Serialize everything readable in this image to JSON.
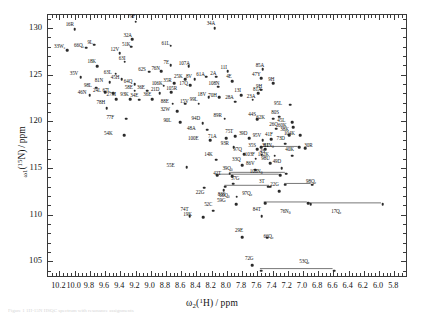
{
  "figure": {
    "caption": "Figure 1  1H-15N HSQC spectrum with resonance assignments"
  },
  "chart_data": {
    "type": "scatter",
    "title": "",
    "xlabel": "ω₂(¹H)/ppm",
    "ylabel": "ω₁(¹⁵N)/ppm",
    "xlim": [
      10.35,
      5.62
    ],
    "ylim": [
      131.4,
      103.2
    ],
    "x_inverted": true,
    "y_inverted": true,
    "grid": false,
    "legend": null,
    "xticks": [
      10.2,
      10.0,
      9.8,
      9.6,
      9.4,
      9.2,
      9.0,
      8.8,
      8.6,
      8.4,
      8.2,
      8.0,
      7.8,
      7.6,
      7.4,
      7.2,
      7.0,
      6.8,
      6.6,
      6.4,
      6.2,
      6.0,
      5.8
    ],
    "xticklabels": [
      "10.2",
      "10.0",
      "9.8",
      "9.6",
      "9.4",
      "9.2",
      "9.0",
      "8.8",
      "8.6",
      "8.4",
      "8.2",
      "8.0",
      "7.8",
      "7.6",
      "7.4",
      "7.2",
      "7.0",
      "6.8",
      "6.6",
      "6.4",
      "6.2",
      "6.0",
      "5.8"
    ],
    "xtick_minor_step": 0.05,
    "yticks": [
      105,
      110,
      115,
      120,
      125,
      130
    ],
    "yticklabels": [
      "105",
      "110",
      "115",
      "120",
      "125",
      "130"
    ],
    "ytick_minor_step": 1,
    "marker": "filled-circle",
    "marker_color": "#2b2b2b",
    "sidechain_link_color": "#555555",
    "points": [
      {
        "label": "29E",
        "sub": "",
        "x": 7.8,
        "y": 107.6,
        "lx": -3,
        "ly": -6
      },
      {
        "label": "72G",
        "sub": "",
        "x": 7.67,
        "y": 104.6,
        "lx": -3,
        "ly": -6
      },
      {
        "label": "19K",
        "sub": "",
        "x": 8.31,
        "y": 109.7,
        "lx": -16,
        "ly": -2
      },
      {
        "label": "59G",
        "sub": "",
        "x": 7.88,
        "y": 111.1,
        "lx": -15,
        "ly": -3
      },
      {
        "label": "83S",
        "sub": "",
        "x": 7.87,
        "y": 111.9,
        "lx": -15,
        "ly": -2
      },
      {
        "label": "37G",
        "sub": "",
        "x": 7.92,
        "y": 113.3,
        "lx": 2,
        "ly": -5
      },
      {
        "label": "42T",
        "sub": "",
        "x": 7.93,
        "y": 114.1,
        "lx": -15,
        "ly": -2
      },
      {
        "label": "74T",
        "sub": "",
        "x": 8.49,
        "y": 109.8,
        "lx": -5,
        "ly": -6
      },
      {
        "label": "52C",
        "sub": "",
        "x": 8.18,
        "y": 110.4,
        "lx": -5,
        "ly": -6
      },
      {
        "label": "84T",
        "sub": "",
        "x": 7.54,
        "y": 109.8,
        "lx": -5,
        "ly": -6
      },
      {
        "label": "3T",
        "sub": "",
        "x": 7.46,
        "y": 113.0,
        "lx": -5,
        "ly": -5
      },
      {
        "label": "22G",
        "sub": "",
        "x": 7.31,
        "y": 112.5,
        "lx": -5,
        "ly": -6
      },
      {
        "label": "49D",
        "sub": "",
        "x": 7.28,
        "y": 115.0,
        "lx": -5,
        "ly": -6
      },
      {
        "label": "55E",
        "sub": "",
        "x": 8.53,
        "y": 115.1,
        "lx": -16,
        "ly": -1
      },
      {
        "label": "14K",
        "sub": "",
        "x": 8.14,
        "y": 115.9,
        "lx": -8,
        "ly": -5
      },
      {
        "label": "33Q",
        "sub": "",
        "x": 7.8,
        "y": 115.3,
        "lx": -6,
        "ly": -5
      },
      {
        "label": "86V",
        "sub": "",
        "x": 7.63,
        "y": 114.8,
        "lx": -5,
        "ly": -6
      },
      {
        "label": "97Q",
        "sub": "",
        "x": 7.77,
        "y": 116.5,
        "lx": -7,
        "ly": -4
      },
      {
        "label": "4S",
        "sub": "",
        "x": 7.54,
        "y": 116.4,
        "lx": 2,
        "ly": -3
      },
      {
        "label": "93R",
        "sub": "",
        "x": 7.91,
        "y": 117.2,
        "lx": -9,
        "ly": -3
      },
      {
        "label": "35S",
        "sub": "",
        "x": 7.6,
        "y": 117.0,
        "lx": -5,
        "ly": -3
      },
      {
        "label": "31I",
        "sub": "",
        "x": 7.5,
        "y": 117.0,
        "lx": 1,
        "ly": -3
      },
      {
        "label": "54K",
        "sub": "",
        "x": 9.35,
        "y": 118.5,
        "lx": -16,
        "ly": -1
      },
      {
        "label": "100E",
        "sub": "",
        "x": 8.22,
        "y": 118.0,
        "lx": -18,
        "ly": -1
      },
      {
        "label": "71A",
        "sub": "",
        "x": 8.01,
        "y": 118.2,
        "lx": -14,
        "ly": -1
      },
      {
        "label": "48A",
        "sub": "",
        "x": 8.26,
        "y": 119.1,
        "lx": -16,
        "ly": -1
      },
      {
        "label": "75T",
        "sub": "",
        "x": 7.89,
        "y": 118.4,
        "lx": -6,
        "ly": -4
      },
      {
        "label": "39D",
        "sub": "",
        "x": 7.71,
        "y": 118.2,
        "lx": -6,
        "ly": -4
      },
      {
        "label": "95V",
        "sub": "",
        "x": 7.53,
        "y": 118.0,
        "lx": -6,
        "ly": -4
      },
      {
        "label": "41F",
        "sub": "",
        "x": 7.42,
        "y": 118.1,
        "lx": -2,
        "ly": -4
      },
      {
        "label": "73D",
        "sub": "",
        "x": 7.23,
        "y": 117.6,
        "lx": -5,
        "ly": -5
      },
      {
        "label": "38K",
        "sub": "",
        "x": 7.18,
        "y": 118.5,
        "lx": -5,
        "ly": -5
      },
      {
        "label": "62K",
        "sub": "",
        "x": 7.39,
        "y": 120.3,
        "lx": -13,
        "ly": -1
      },
      {
        "label": "26Q",
        "sub": "",
        "x": 7.35,
        "y": 119.2,
        "lx": -3,
        "ly": -4
      },
      {
        "label": "77F",
        "sub": "",
        "x": 9.32,
        "y": 120.3,
        "lx": -16,
        "ly": -1
      },
      {
        "label": "90L",
        "sub": "",
        "x": 8.61,
        "y": 119.9,
        "lx": -13,
        "ly": -1
      },
      {
        "label": "32W",
        "sub": "",
        "x": 8.65,
        "y": 121.1,
        "lx": -13,
        "ly": -1
      },
      {
        "label": "94D",
        "sub": "",
        "x": 8.32,
        "y": 119.8,
        "lx": -7,
        "ly": -4
      },
      {
        "label": "89R",
        "sub": "",
        "x": 8.03,
        "y": 120.3,
        "lx": -7,
        "ly": -3
      },
      {
        "label": "44S",
        "sub": "",
        "x": 7.6,
        "y": 120.2,
        "lx": -5,
        "ly": -4
      },
      {
        "label": "80S",
        "sub": "",
        "x": 7.31,
        "y": 120.5,
        "lx": -4,
        "ly": -4
      },
      {
        "label": "45L",
        "sub": "",
        "x": 7.14,
        "y": 119.9,
        "lx": -11,
        "ly": -1
      },
      {
        "label": "78H",
        "sub": "",
        "x": 9.58,
        "y": 121.4,
        "lx": -6,
        "ly": -5
      },
      {
        "label": "27M",
        "sub": "",
        "x": 9.45,
        "y": 122.4,
        "lx": -6,
        "ly": -4
      },
      {
        "label": "93K",
        "sub": "",
        "x": 9.27,
        "y": 122.4,
        "lx": -6,
        "ly": -4
      },
      {
        "label": "88E",
        "sub": "",
        "x": 8.71,
        "y": 121.9,
        "lx": -8,
        "ly": -2
      },
      {
        "label": "15V",
        "sub": "",
        "x": 8.55,
        "y": 121.9,
        "lx": -1,
        "ly": -2
      },
      {
        "label": "99L",
        "sub": "",
        "x": 8.37,
        "y": 121.9,
        "lx": -5,
        "ly": -4
      },
      {
        "label": "18V",
        "sub": "",
        "x": 8.24,
        "y": 122.6,
        "lx": -7,
        "ly": -2
      },
      {
        "label": "70H",
        "sub": "",
        "x": 8.1,
        "y": 122.6,
        "lx": -7,
        "ly": -1
      },
      {
        "label": "28A",
        "sub": "",
        "x": 7.89,
        "y": 122.1,
        "lx": -6,
        "ly": -4
      },
      {
        "label": "23A",
        "sub": "",
        "x": 7.66,
        "y": 122.3,
        "lx": -2,
        "ly": -3
      },
      {
        "label": "95L",
        "sub": "",
        "x": 7.17,
        "y": 121.8,
        "lx": -12,
        "ly": -1
      },
      {
        "label": "34E",
        "sub": "",
        "x": 9.15,
        "y": 122.3,
        "lx": -5,
        "ly": -4
      },
      {
        "label": "36E",
        "sub": "",
        "x": 8.98,
        "y": 122.4,
        "lx": -5,
        "ly": -4
      },
      {
        "label": "13I",
        "sub": "",
        "x": 7.81,
        "y": 122.8,
        "lx": -3,
        "ly": -4
      },
      {
        "label": "81A",
        "sub": "",
        "x": 7.59,
        "y": 123.0,
        "lx": -1,
        "ly": -3
      },
      {
        "label": "24L",
        "sub": "",
        "x": 9.6,
        "y": 123.1,
        "lx": -8,
        "ly": -1
      },
      {
        "label": "67L",
        "sub": "",
        "x": 9.49,
        "y": 123.0,
        "lx": -7,
        "ly": -2
      },
      {
        "label": "58E",
        "sub": "",
        "x": 9.21,
        "y": 123.3,
        "lx": -6,
        "ly": -3
      },
      {
        "label": "36E",
        "sub": "",
        "x": 9.05,
        "y": 123.3,
        "lx": -6,
        "ly": -3
      },
      {
        "label": "21D",
        "sub": "",
        "x": 8.88,
        "y": 123.0,
        "lx": -5,
        "ly": -3
      },
      {
        "label": "105R",
        "sub": "",
        "x": 8.73,
        "y": 123.1,
        "lx": -1,
        "ly": -3
      },
      {
        "label": "106K",
        "sub": "",
        "x": 8.83,
        "y": 123.8,
        "lx": -8,
        "ly": -2
      },
      {
        "label": "17Q",
        "sub": "",
        "x": 8.48,
        "y": 123.9,
        "lx": -7,
        "ly": -1
      },
      {
        "label": "108N",
        "sub": "",
        "x": 8.11,
        "y": 123.7,
        "lx": -6,
        "ly": -3
      },
      {
        "label": "9H",
        "sub": "",
        "x": 7.55,
        "y": 123.4,
        "lx": -1,
        "ly": -3
      },
      {
        "label": "46N",
        "sub": "",
        "x": 9.8,
        "y": 122.8,
        "lx": -8,
        "ly": -2
      },
      {
        "label": "98L",
        "sub": "",
        "x": 9.72,
        "y": 123.6,
        "lx": -8,
        "ly": -2
      },
      {
        "label": "81N",
        "sub": "",
        "x": 9.54,
        "y": 124.2,
        "lx": -11,
        "ly": -1
      },
      {
        "label": "45H",
        "sub": "",
        "x": 9.38,
        "y": 124.5,
        "lx": -7,
        "ly": -1
      },
      {
        "label": "64Q",
        "sub": "",
        "x": 9.21,
        "y": 124.0,
        "lx": -7,
        "ly": -2
      },
      {
        "label": "35R",
        "sub": "",
        "x": 8.69,
        "y": 124.1,
        "lx": -7,
        "ly": -2
      },
      {
        "label": "25K",
        "sub": "",
        "x": 8.55,
        "y": 124.5,
        "lx": -7,
        "ly": -2
      },
      {
        "label": "8V",
        "sub": "",
        "x": 8.42,
        "y": 124.5,
        "lx": -5,
        "ly": -2
      },
      {
        "label": "61A",
        "sub": "",
        "x": 8.27,
        "y": 124.8,
        "lx": -6,
        "ly": -2
      },
      {
        "label": "2A",
        "sub": "",
        "x": 8.14,
        "y": 124.8,
        "lx": -2,
        "ly": -3
      },
      {
        "label": "4E",
        "sub": "",
        "x": 7.93,
        "y": 124.3,
        "lx": -2,
        "ly": -4
      },
      {
        "label": "47Y",
        "sub": "",
        "x": 7.55,
        "y": 124.6,
        "lx": -5,
        "ly": -3
      },
      {
        "label": "9H",
        "sub": "",
        "x": 7.39,
        "y": 124.1,
        "lx": -1,
        "ly": -3
      },
      {
        "label": "63L",
        "sub": "",
        "x": 9.46,
        "y": 125.1,
        "lx": -8,
        "ly": -1
      },
      {
        "label": "62S",
        "sub": "",
        "x": 9.02,
        "y": 125.3,
        "lx": -7,
        "ly": -2
      },
      {
        "label": "76N",
        "sub": "",
        "x": 8.86,
        "y": 125.4,
        "lx": -6,
        "ly": -2
      },
      {
        "label": "7E",
        "sub": "",
        "x": 8.74,
        "y": 126.0,
        "lx": -3,
        "ly": -2
      },
      {
        "label": "107A",
        "sub": "",
        "x": 8.5,
        "y": 125.9,
        "lx": -6,
        "ly": -2
      },
      {
        "label": "11I",
        "sub": "",
        "x": 7.99,
        "y": 125.4,
        "lx": -3,
        "ly": -3
      },
      {
        "label": "85A",
        "sub": "",
        "x": 7.53,
        "y": 125.6,
        "lx": -3,
        "ly": -3
      },
      {
        "label": "18K",
        "sub": "",
        "x": 9.7,
        "y": 125.9,
        "lx": -6,
        "ly": -4
      },
      {
        "label": "63I",
        "sub": "",
        "x": 9.34,
        "y": 126.4,
        "lx": -2,
        "ly": -3
      },
      {
        "label": "35V",
        "sub": "",
        "x": 9.92,
        "y": 124.7,
        "lx": -7,
        "ly": -3
      },
      {
        "label": "33W",
        "sub": "e",
        "x": 10.1,
        "y": 127.6,
        "lx": -9,
        "ly": -3
      },
      {
        "label": "66Q",
        "sub": "e",
        "x": 9.85,
        "y": 127.9,
        "lx": -8,
        "ly": -2
      },
      {
        "label": "9L",
        "sub": "",
        "x": 9.74,
        "y": 128.2,
        "lx": -3,
        "ly": -2
      },
      {
        "label": "12V",
        "sub": "",
        "x": 9.41,
        "y": 127.3,
        "lx": -5,
        "ly": -3
      },
      {
        "label": "51K",
        "sub": "",
        "x": 9.26,
        "y": 128.0,
        "lx": -5,
        "ly": -2
      },
      {
        "label": "32A",
        "sub": "",
        "x": 9.24,
        "y": 128.8,
        "lx": -5,
        "ly": -3
      },
      {
        "label": "61L",
        "sub": "",
        "x": 8.74,
        "y": 128.1,
        "lx": -5,
        "ly": -2
      },
      {
        "label": "16R",
        "sub": "",
        "x": 10.0,
        "y": 129.9,
        "lx": -5,
        "ly": -4
      },
      {
        "label": "79F",
        "sub": "",
        "x": 9.2,
        "y": 130.7,
        "lx": -4,
        "ly": -5
      },
      {
        "label": "34A",
        "sub": "",
        "x": 8.16,
        "y": 130.0,
        "lx": -4,
        "ly": -4
      },
      {
        "label": "30R",
        "sub": "",
        "x": 6.97,
        "y": 117.1,
        "lx": 3,
        "ly": -2
      },
      {
        "label": "40K",
        "sub": "",
        "x": 7.14,
        "y": 116.3,
        "lx": -3,
        "ly": -6
      },
      {
        "label": "102K",
        "sub": "",
        "x": 7.37,
        "y": 116.3,
        "lx": -13,
        "ly": -1
      },
      {
        "label": "103F",
        "sub": "",
        "x": 7.62,
        "y": 116.0,
        "lx": -7,
        "ly": -4
      },
      {
        "label": "98U",
        "sub": "",
        "x": 7.43,
        "y": 115.5,
        "lx": -5,
        "ly": -4
      },
      {
        "label": "104K",
        "sub": "",
        "x": 7.04,
        "y": 118.5,
        "lx": -12,
        "ly": -1
      },
      {
        "label": "60K",
        "sub": "",
        "x": 7.13,
        "y": 119.4,
        "lx": -11,
        "ly": -1
      }
    ],
    "sidechain_pairs": [
      {
        "label": "53Q",
        "sub": "ε",
        "x1": 7.55,
        "x2": 6.59,
        "y": 104.0,
        "lx": 6.97,
        "ly": 104.9
      },
      {
        "label": "66Q",
        "sub": "ε",
        "x1": 7.47,
        "x2": 7.47,
        "y": 107.5,
        "lx": 7.44,
        "ly": 107.6,
        "single": true
      },
      {
        "label": "76N",
        "sub": "δ",
        "x1": 7.5,
        "x2": 6.93,
        "y": 111.2,
        "lx": 7.22,
        "ly": 110.3
      },
      {
        "label": "17Q",
        "sub": "ε",
        "x1": 6.9,
        "x2": 5.95,
        "y": 111.1,
        "lx": 6.55,
        "ly": 110.3
      },
      {
        "label": "66Q",
        "sub": "δ",
        "x1": 8.04,
        "x2": 8.04,
        "y": 112.6,
        "lx": 8.02,
        "ly": 112.0
      },
      {
        "label": "97Q",
        "sub": "ε",
        "x1": 8.02,
        "x2": 7.43,
        "y": 113.0,
        "lx": 7.72,
        "ly": 112.2
      },
      {
        "label": "98Q",
        "sub": "ε",
        "x1": 7.23,
        "x2": 6.88,
        "y": 113.2,
        "lx": 6.88,
        "ly": 113.5
      },
      {
        "label": "39Q",
        "sub": "δ",
        "x1": 8.13,
        "x2": 7.3,
        "y": 114.2,
        "lx": 7.98,
        "ly": 114.9
      },
      {
        "label": "108N",
        "sub": "δ",
        "x1": 7.96,
        "x2": 7.22,
        "y": 114.4,
        "lx": 7.62,
        "ly": 114.6
      },
      {
        "label": "81N",
        "sub": "δ",
        "x1": 7.55,
        "x2": 7.05,
        "y": 117.2,
        "lx": 7.44,
        "ly": 117.4
      },
      {
        "label": "22G",
        "sub": "",
        "x1": 8.3,
        "x2": 8.3,
        "y": 112.9,
        "lx": 8.33,
        "ly": 112.3,
        "single": true
      }
    ]
  }
}
